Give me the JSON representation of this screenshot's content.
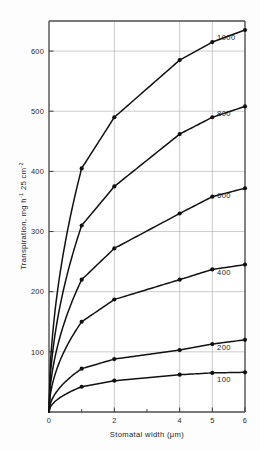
{
  "chart_data": {
    "type": "line",
    "title": "",
    "xlabel": "Stomatal width (μm)",
    "ylabel": "Transpiration, mg h⁻¹ 25 cm⁻²",
    "ylabel_parts": {
      "main": "Transpiration, mg h",
      "sup1": "-1",
      "mid": " 25 cm",
      "sup2": "-2"
    },
    "xlim": [
      0,
      6
    ],
    "ylim": [
      0,
      650
    ],
    "grid": true,
    "legend_position": "inline-right",
    "x_ticks": [
      0,
      2,
      4,
      5,
      6
    ],
    "x_tick_labels": [
      "0",
      "2",
      "4",
      "5",
      "6"
    ],
    "x_minor_ticks": [
      1,
      3
    ],
    "y_ticks": [
      100,
      200,
      300,
      400,
      500,
      600
    ],
    "y_tick_labels": [
      "100",
      "200",
      "300",
      "400",
      "500",
      "600"
    ],
    "x": [
      0,
      1,
      2,
      4,
      5,
      6
    ],
    "series": [
      {
        "name": "1000",
        "label": "1000",
        "values": [
          0,
          405,
          490,
          585,
          615,
          635
        ]
      },
      {
        "name": "800",
        "label": "800",
        "values": [
          0,
          310,
          375,
          462,
          490,
          508
        ]
      },
      {
        "name": "600",
        "label": "600",
        "values": [
          0,
          220,
          272,
          330,
          358,
          372
        ]
      },
      {
        "name": "400",
        "label": "400",
        "values": [
          0,
          150,
          187,
          220,
          237,
          245
        ]
      },
      {
        "name": "200",
        "label": "200",
        "values": [
          0,
          72,
          88,
          103,
          113,
          120
        ]
      },
      {
        "name": "100",
        "label": "100",
        "values": [
          0,
          42,
          52,
          62,
          65,
          66
        ]
      }
    ],
    "colors": {
      "line": "#111111",
      "marker": "#111111",
      "grid": "#b5b5b5",
      "frame": "#4d4d4d",
      "background": "#fdfdfd"
    }
  }
}
